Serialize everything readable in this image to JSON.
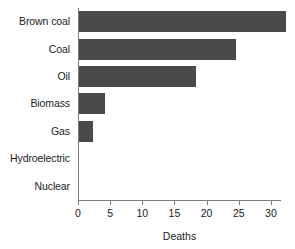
{
  "chart_data": {
    "type": "bar",
    "orientation": "horizontal",
    "title": "",
    "xlabel": "Deaths",
    "ylabel": "",
    "categories": [
      "Brown coal",
      "Coal",
      "Oil",
      "Biomass",
      "Gas",
      "Hydroelectric",
      "Nuclear"
    ],
    "values": [
      32.3,
      24.6,
      18.4,
      4.2,
      2.3,
      0.04,
      0.03
    ],
    "xlim": [
      0,
      32.5
    ],
    "xticks": [
      0,
      5,
      10,
      15,
      20,
      25,
      30
    ],
    "xtick_labels": [
      "0",
      "5",
      "10",
      "15",
      "20",
      "25",
      "30"
    ],
    "grid": false,
    "legend": null,
    "bar_color": "#4a4a4a",
    "background_color": "#ffffff",
    "axis_color": "#7d7d7d"
  }
}
